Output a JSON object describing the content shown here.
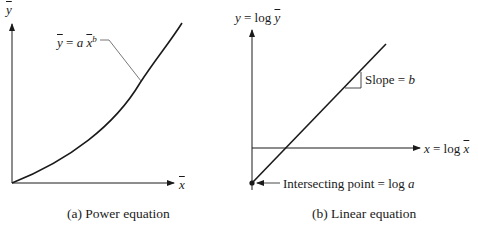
{
  "panels": [
    {
      "id": "a",
      "caption": "(a) Power equation",
      "y_axis_label": "y",
      "x_axis_label": "x",
      "curve_label": {
        "lhs": "y",
        "eq": "=",
        "coef": "a",
        "var": "x",
        "exp": "b"
      },
      "curve_type": "power"
    },
    {
      "id": "b",
      "caption": "(b) Linear equation",
      "y_axis_label": {
        "var": "y",
        "eq": "= log",
        "bar_var": "y"
      },
      "x_axis_label": {
        "var": "x",
        "eq": "= log",
        "bar_var": "x"
      },
      "slope_label": {
        "text": "Slope = ",
        "var": "b"
      },
      "intercept_label": {
        "text": "Intersecting point = log ",
        "var": "a"
      },
      "curve_type": "linear"
    }
  ]
}
